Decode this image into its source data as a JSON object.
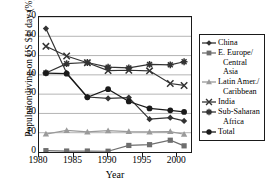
{
  "chart_data": {
    "type": "line",
    "title": "",
    "xlabel": "Year",
    "ylabel": "Population living on US $1/ day (%)",
    "xlim": [
      1980,
      2002
    ],
    "ylim": [
      0,
      70
    ],
    "xticks": [
      1980,
      1985,
      1990,
      1995,
      2000
    ],
    "yticks": [
      0,
      10,
      20,
      30,
      40,
      50,
      60,
      70
    ],
    "grid": "horizontal",
    "legend_position": "right",
    "x": [
      1981,
      1984,
      1987,
      1990,
      1993,
      1996,
      1999,
      2001
    ],
    "series": [
      {
        "name": "China",
        "marker": "diamond",
        "color": "#333333",
        "values": [
          64,
          41,
          28.5,
          27.8,
          28.2,
          17,
          17.8,
          16.1
        ]
      },
      {
        "name": "E. Europe/ Central Asia",
        "marker": "square",
        "color": "#6e6e6e",
        "values": [
          0.7,
          0.5,
          0.5,
          0.4,
          3.4,
          3.8,
          6.1,
          3.2
        ]
      },
      {
        "name": "Latin Amer./ Caribbean",
        "marker": "triangle",
        "color": "#9a9a9a",
        "values": [
          9.3,
          11.2,
          10.4,
          11.1,
          10.6,
          10.4,
          10.6,
          9.2
        ]
      },
      {
        "name": "India",
        "marker": "x",
        "color": "#333333",
        "values": [
          54.8,
          49.8,
          46.3,
          42.2,
          42.4,
          42.1,
          35.5,
          34.5
        ]
      },
      {
        "name": "Sub-Saharan Africa",
        "marker": "star",
        "color": "#333333",
        "values": [
          41.0,
          45.8,
          46.4,
          44.0,
          43.6,
          45.4,
          45.2,
          46.8
        ]
      },
      {
        "name": "Total",
        "marker": "circle",
        "color": "#1a1a1a",
        "values": [
          40.9,
          40.6,
          28.4,
          32.6,
          26.2,
          22.6,
          21.6,
          20.8
        ]
      }
    ]
  },
  "legend": {
    "entries": [
      {
        "label": "China",
        "cont": ""
      },
      {
        "label": "E. Europe/",
        "cont": "Central Asia"
      },
      {
        "label": "Latin Amer./",
        "cont": "Caribbean"
      },
      {
        "label": "India",
        "cont": ""
      },
      {
        "label": "Sub-Saharan",
        "cont": "Africa"
      },
      {
        "label": "Total",
        "cont": ""
      }
    ]
  }
}
